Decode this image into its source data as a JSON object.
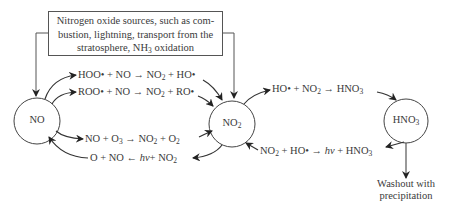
{
  "source_box": {
    "line1": "Nitrogen oxide sources, such as com-",
    "line2": "bustion, lightning, transport from the",
    "line3_pre": "stratosphere, NH",
    "line3_sub": "3",
    "line3_post": " oxidation"
  },
  "nodes": {
    "no": {
      "label": "NO"
    },
    "no2": {
      "label": "NO",
      "sub": "2"
    },
    "hno3": {
      "label": "HNO",
      "sub": "3"
    }
  },
  "reactions": {
    "r1": {
      "a": "HOO• + NO  → NO",
      "sub": "2",
      "b": " + HO•"
    },
    "r2": {
      "a": "ROO• + NO  → NO",
      "sub": "2",
      "b": " + RO•"
    },
    "r3": {
      "a": "NO + O",
      "sub1": "3",
      "b": "  → NO",
      "sub2": "2",
      "c": " + O",
      "sub3": "2"
    },
    "r4": {
      "a": "O + NO  ← ",
      "hv": "hν",
      "b": "+ NO",
      "sub": "2"
    },
    "r5": {
      "a": "HO• + NO",
      "sub1": "2",
      "b": "  → HNO",
      "sub2": "3"
    },
    "r6": {
      "a": "NO",
      "sub1": "2",
      "b": " + HO•  → ",
      "hv": "hν",
      "c": " + HNO",
      "sub2": "3"
    }
  },
  "washout": {
    "line1": "Washout with",
    "line2": "precipitation"
  }
}
